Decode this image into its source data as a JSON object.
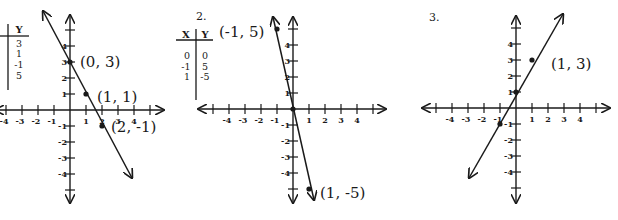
{
  "chart_data": [
    {
      "type": "line",
      "title": "",
      "problem_label": "",
      "xlabel": "",
      "ylabel": "",
      "xlim": [
        -5,
        5
      ],
      "ylim": [
        -5,
        5
      ],
      "grid": false,
      "x_ticks": [
        -4,
        -3,
        -2,
        -1,
        1,
        2,
        3,
        4
      ],
      "y_ticks": [
        -4,
        -3,
        -2,
        -1,
        1,
        2,
        3,
        4
      ],
      "equation": "y = -2x + 3",
      "points": [
        {
          "x": 0,
          "y": 3,
          "label": "(0, 3)"
        },
        {
          "x": 1,
          "y": 1,
          "label": "(1, 1)"
        },
        {
          "x": 2,
          "y": -1,
          "label": "(2, -1)"
        }
      ],
      "table": {
        "headers": [
          "X",
          "Y"
        ],
        "rows": [
          [
            "0",
            "3"
          ],
          [
            "1",
            "1"
          ],
          [
            "2",
            "-1"
          ],
          [
            "-1",
            "5"
          ]
        ],
        "visible_columns": [
          "Y"
        ],
        "visible_values": [
          "3",
          "1",
          "-1",
          "5"
        ]
      },
      "layout": {
        "ox": 70,
        "oy": 110,
        "unit": 16,
        "arrow_from": [
          43,
          11
        ],
        "arrow_to": [
          132,
          178
        ],
        "yaxis_top": 15,
        "yaxis_bottom": 203,
        "xaxis_left": -5,
        "xaxis_right": 164
      }
    },
    {
      "type": "line",
      "title": "",
      "problem_label": "2.",
      "xlabel": "",
      "ylabel": "",
      "xlim": [
        -5,
        5
      ],
      "ylim": [
        -5,
        5
      ],
      "grid": false,
      "x_ticks": [
        -4,
        -3,
        -2,
        -1,
        1,
        2,
        3,
        4
      ],
      "y_ticks": [
        -4,
        -3,
        -2,
        -1,
        1,
        2,
        3,
        4
      ],
      "equation": "y = -5x",
      "points": [
        {
          "x": -1,
          "y": 5,
          "label": "(-1, 5)"
        },
        {
          "x": 0,
          "y": 0,
          "label": ""
        },
        {
          "x": 1,
          "y": -5,
          "label": "(1, -5)"
        }
      ],
      "table": {
        "headers": [
          "X",
          "Y"
        ],
        "rows": [
          [
            "0",
            "0"
          ],
          [
            "-1",
            "5"
          ],
          [
            "1",
            "-5"
          ]
        ]
      },
      "layout": {
        "ox": 293,
        "oy": 109,
        "unit": 16,
        "arrow_from": [
          273,
          17
        ],
        "arrow_to": [
          314,
          200
        ],
        "yaxis_top": 17,
        "yaxis_bottom": 203,
        "xaxis_left": 198,
        "xaxis_right": 386
      }
    },
    {
      "type": "line",
      "title": "",
      "problem_label": "3.",
      "xlabel": "",
      "ylabel": "",
      "xlim": [
        -5,
        5
      ],
      "ylim": [
        -5,
        5
      ],
      "grid": false,
      "x_ticks": [
        -4,
        -3,
        -2,
        -1,
        1,
        2,
        3,
        4
      ],
      "y_ticks": [
        -4,
        -3,
        -2,
        -1,
        1,
        2,
        3,
        4
      ],
      "equation": "y = 2x + 1",
      "points": [
        {
          "x": -1,
          "y": -1,
          "label": ""
        },
        {
          "x": 0,
          "y": 1,
          "label": ""
        },
        {
          "x": 1,
          "y": 3,
          "label": "(1, 3)"
        }
      ],
      "table": null,
      "layout": {
        "ox": 516,
        "oy": 108,
        "unit": 16,
        "arrow_from": [
          469,
          178
        ],
        "arrow_to": [
          563,
          14
        ],
        "yaxis_top": 16,
        "yaxis_bottom": 203,
        "xaxis_left": 422,
        "xaxis_right": 610
      }
    }
  ],
  "labels": {
    "problem2": "2.",
    "problem3": "3.",
    "g1_p0": "(0, 3)",
    "g1_p1": "(1, 1)",
    "g1_p2": "(2, -1)",
    "g2_p0": "(-1, 5)",
    "g2_p1": "(1, -5)",
    "g3_p0": "(1, 3)"
  },
  "colors": {
    "ink": "#1a1a1a",
    "paper": "#ffffff"
  }
}
